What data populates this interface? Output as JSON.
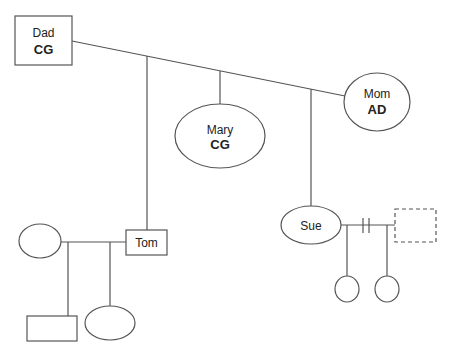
{
  "diagram": {
    "type": "genogram",
    "colors": {
      "line": "#555555",
      "text": "#222222",
      "background": "#ffffff"
    },
    "nodes": {
      "dad": {
        "name": "Dad",
        "tag": "CG",
        "shape": "square"
      },
      "mom": {
        "name": "Mom",
        "tag": "AD",
        "shape": "circle"
      },
      "mary": {
        "name": "Mary",
        "tag": "CG",
        "shape": "circle"
      },
      "tom": {
        "name": "Tom",
        "shape": "square"
      },
      "sue": {
        "name": "Sue",
        "shape": "circle"
      },
      "tom_partner": {
        "name": "",
        "shape": "circle"
      },
      "tom_child_1": {
        "name": "",
        "shape": "square"
      },
      "tom_child_2": {
        "name": "",
        "shape": "circle"
      },
      "sue_partner": {
        "name": "",
        "shape": "square",
        "style": "dashed"
      },
      "sue_child_1": {
        "name": "",
        "shape": "circle"
      },
      "sue_child_2": {
        "name": "",
        "shape": "circle"
      }
    },
    "relationships": [
      {
        "from": "dad",
        "to": "mom",
        "type": "marriage"
      },
      {
        "from": "tom",
        "to": "tom_partner",
        "type": "marriage"
      },
      {
        "from": "sue",
        "to": "sue_partner",
        "type": "divorce"
      }
    ]
  }
}
